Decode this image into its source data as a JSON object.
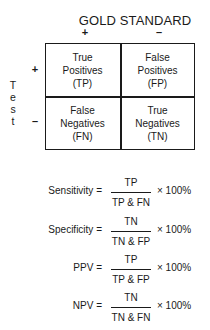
{
  "header": {
    "title": "GOLD STANDARD",
    "col_signs": [
      "+",
      "–"
    ]
  },
  "side": {
    "label_letters": [
      "T",
      "e",
      "s",
      "t"
    ],
    "row_signs": [
      "+",
      "–"
    ]
  },
  "matrix": {
    "cells": [
      {
        "line1": "True",
        "line2": "Positives",
        "abbr": "(TP)"
      },
      {
        "line1": "False",
        "line2": "Positives",
        "abbr": "(FP)"
      },
      {
        "line1": "False",
        "line2": "Negatives",
        "abbr": "(FN)"
      },
      {
        "line1": "True",
        "line2": "Negatives",
        "abbr": "(TN)"
      }
    ]
  },
  "formulas": [
    {
      "label": "Sensitivity =",
      "numerator": "TP",
      "denominator": "TP & FN",
      "multiplier": "× 100%"
    },
    {
      "label": "Specificity =",
      "numerator": "TN",
      "denominator": "TN & FP",
      "multiplier": "× 100%"
    },
    {
      "label": "PPV =",
      "numerator": "TP",
      "denominator": "TP & FP",
      "multiplier": "× 100%"
    },
    {
      "label": "NPV =",
      "numerator": "TN",
      "denominator": "TN & FN",
      "multiplier": "× 100%"
    }
  ]
}
